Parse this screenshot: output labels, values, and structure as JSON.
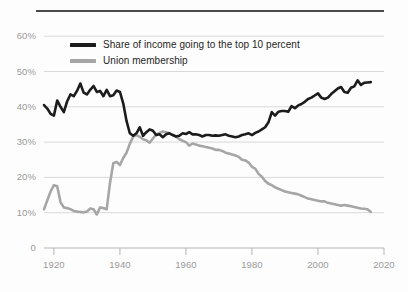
{
  "chart_data": {
    "type": "line",
    "title": "",
    "subtitle": "",
    "xlabel": "",
    "ylabel": "",
    "xlim": [
      1917,
      2020
    ],
    "ylim": [
      0,
      62
    ],
    "grid": true,
    "legend_position": "top-left-inside",
    "x_ticks": [
      "1920",
      "1940",
      "1960",
      "1980",
      "2000",
      "2020"
    ],
    "x_tick_values": [
      1920,
      1940,
      1960,
      1980,
      2000,
      2020
    ],
    "y_ticks": [
      "0",
      "10%",
      "20%",
      "30%",
      "40%",
      "50%",
      "60%"
    ],
    "y_tick_values": [
      0,
      10,
      20,
      30,
      40,
      50,
      60
    ],
    "series": [
      {
        "name": "Share of income going to the top 10 percent",
        "color": "#1c1c1c",
        "width": 2.6,
        "x": [
          1917,
          1918,
          1919,
          1920,
          1921,
          1922,
          1923,
          1924,
          1925,
          1926,
          1927,
          1928,
          1929,
          1930,
          1931,
          1932,
          1933,
          1934,
          1935,
          1936,
          1937,
          1938,
          1939,
          1940,
          1941,
          1942,
          1943,
          1944,
          1945,
          1946,
          1947,
          1948,
          1949,
          1950,
          1951,
          1952,
          1953,
          1954,
          1955,
          1956,
          1957,
          1958,
          1959,
          1960,
          1961,
          1962,
          1963,
          1964,
          1965,
          1966,
          1967,
          1968,
          1969,
          1970,
          1971,
          1972,
          1973,
          1974,
          1975,
          1976,
          1977,
          1978,
          1979,
          1980,
          1981,
          1982,
          1983,
          1984,
          1985,
          1986,
          1987,
          1988,
          1989,
          1990,
          1991,
          1992,
          1993,
          1994,
          1995,
          1996,
          1997,
          1998,
          1999,
          2000,
          2001,
          2002,
          2003,
          2004,
          2005,
          2006,
          2007,
          2008,
          2009,
          2010,
          2011,
          2012,
          2013,
          2014,
          2015,
          2016
        ],
        "values": [
          40.5,
          39.5,
          38.0,
          37.5,
          41.8,
          40.0,
          38.5,
          41.5,
          43.5,
          43.0,
          44.5,
          46.6,
          44.0,
          43.5,
          44.8,
          45.9,
          44.2,
          44.5,
          43.0,
          44.8,
          43.0,
          43.3,
          44.6,
          44.2,
          41.0,
          36.0,
          32.5,
          31.8,
          32.5,
          34.2,
          31.8,
          32.8,
          33.6,
          33.2,
          32.0,
          32.2,
          31.4,
          32.2,
          32.5,
          32.0,
          31.6,
          31.8,
          32.5,
          32.3,
          32.8,
          32.2,
          32.2,
          32.0,
          31.6,
          32.0,
          32.0,
          31.8,
          31.9,
          31.8,
          32.0,
          32.2,
          31.8,
          31.6,
          31.4,
          31.6,
          32.0,
          32.2,
          32.5,
          32.0,
          32.6,
          33.0,
          33.6,
          34.2,
          35.6,
          38.5,
          37.5,
          38.6,
          38.8,
          38.8,
          38.6,
          40.2,
          39.6,
          40.4,
          40.8,
          41.4,
          42.2,
          42.6,
          43.2,
          43.8,
          42.6,
          42.2,
          42.6,
          43.6,
          44.4,
          45.2,
          45.6,
          44.2,
          44.0,
          45.4,
          45.8,
          47.5,
          46.2,
          46.8,
          46.9,
          47.0
        ]
      },
      {
        "name": "Union membership",
        "color": "#a6a6a6",
        "width": 2.6,
        "x": [
          1917,
          1918,
          1919,
          1920,
          1921,
          1922,
          1923,
          1924,
          1925,
          1926,
          1927,
          1928,
          1929,
          1930,
          1931,
          1932,
          1933,
          1934,
          1935,
          1936,
          1937,
          1938,
          1939,
          1940,
          1941,
          1942,
          1943,
          1944,
          1945,
          1946,
          1947,
          1948,
          1949,
          1950,
          1951,
          1952,
          1953,
          1954,
          1955,
          1956,
          1957,
          1958,
          1959,
          1960,
          1961,
          1962,
          1963,
          1964,
          1965,
          1966,
          1967,
          1968,
          1969,
          1970,
          1971,
          1972,
          1973,
          1974,
          1975,
          1976,
          1977,
          1978,
          1979,
          1980,
          1981,
          1982,
          1983,
          1984,
          1985,
          1986,
          1987,
          1988,
          1989,
          1990,
          1991,
          1992,
          1993,
          1994,
          1995,
          1996,
          1997,
          1998,
          1999,
          2000,
          2001,
          2002,
          2003,
          2004,
          2005,
          2006,
          2007,
          2008,
          2009,
          2010,
          2011,
          2012,
          2013,
          2014,
          2015,
          2016
        ],
        "values": [
          11.0,
          13.5,
          16.0,
          17.8,
          17.5,
          13.0,
          11.5,
          11.3,
          11.0,
          10.5,
          10.3,
          10.2,
          10.1,
          10.3,
          11.2,
          11.0,
          9.5,
          11.5,
          11.3,
          11.0,
          18.5,
          24.0,
          24.4,
          23.5,
          25.5,
          27.0,
          29.5,
          31.5,
          32.0,
          31.5,
          30.8,
          30.5,
          29.8,
          31.0,
          32.2,
          32.6,
          33.0,
          32.8,
          32.5,
          32.0,
          31.5,
          30.8,
          30.4,
          30.0,
          29.0,
          29.6,
          29.3,
          29.0,
          28.8,
          28.6,
          28.4,
          28.2,
          27.8,
          27.8,
          27.5,
          27.0,
          26.8,
          26.5,
          26.2,
          25.8,
          25.0,
          24.8,
          24.2,
          23.0,
          22.5,
          21.0,
          20.2,
          19.0,
          18.2,
          17.8,
          17.2,
          16.8,
          16.4,
          16.0,
          15.8,
          15.6,
          15.4,
          15.2,
          14.8,
          14.4,
          14.0,
          13.8,
          13.6,
          13.4,
          13.2,
          13.2,
          12.8,
          12.6,
          12.4,
          12.2,
          12.0,
          12.2,
          12.0,
          11.8,
          11.6,
          11.4,
          11.2,
          11.1,
          11.0,
          10.2
        ]
      }
    ]
  },
  "legend": {
    "entries": [
      {
        "label": "Share of income going to the top 10 percent",
        "swatch": "black-line-swatch"
      },
      {
        "label": "Union membership",
        "swatch": "gray-line-swatch"
      }
    ]
  },
  "colors": {
    "income_line": "#1c1c1c",
    "union_line": "#a6a6a6",
    "gridline": "#d9d9d9",
    "axis_text": "#9a9a9a",
    "top_rule": "#4a4a4a",
    "background": "#fdfdfd"
  }
}
